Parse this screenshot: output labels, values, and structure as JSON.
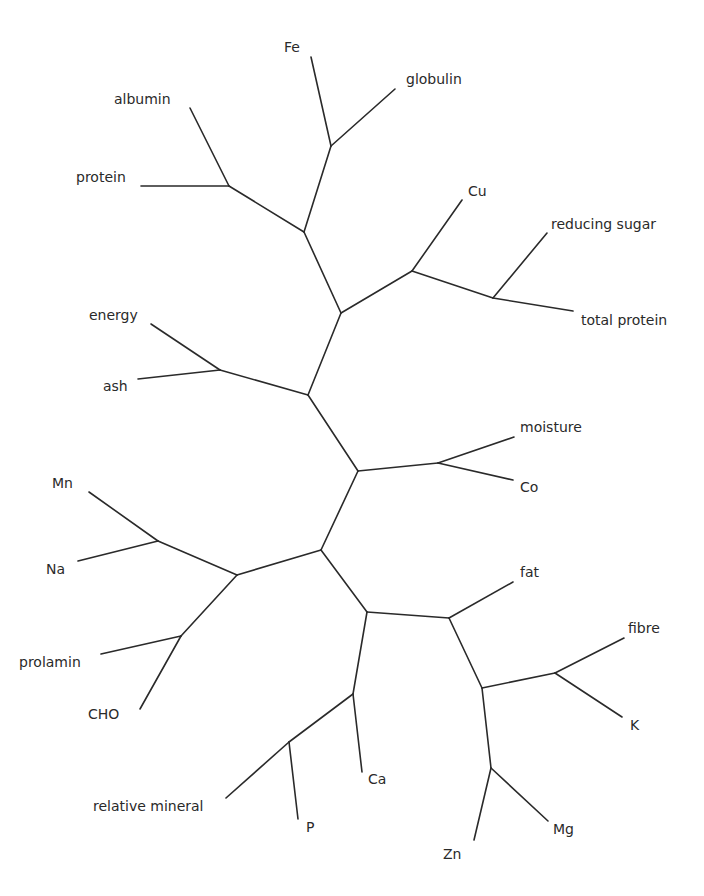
{
  "diagram": {
    "type": "unrooted-tree",
    "colors": {
      "line": "#2a2a2a",
      "text": "#2a2a2a",
      "background": "#ffffff"
    },
    "nodes": {
      "n_fe_glob": [
        331,
        146
      ],
      "n_alb_prot": [
        229,
        186
      ],
      "n_top": [
        304,
        232
      ],
      "n_cu": [
        412,
        271
      ],
      "n_rs_tp": [
        493,
        298
      ],
      "n_upper": [
        341,
        313
      ],
      "n_en_ash": [
        220,
        370
      ],
      "n_mid_up": [
        308,
        395
      ],
      "n_mo_co": [
        438,
        463
      ],
      "n_mid": [
        358,
        471
      ],
      "n_mn_na": [
        158,
        541
      ],
      "n_left": [
        237,
        575
      ],
      "n_center": [
        321,
        550
      ],
      "n_pr_cho": [
        181,
        636
      ],
      "n_low": [
        367,
        612
      ],
      "n_fat": [
        449,
        618
      ],
      "n_ca": [
        353,
        694
      ],
      "n_rm_p": [
        289,
        742
      ],
      "n_fib_k": [
        555,
        673
      ],
      "n_right": [
        482,
        688
      ],
      "n_zn_mg": [
        491,
        768
      ],
      "Fe": [
        311,
        57
      ],
      "globulin": [
        395,
        89
      ],
      "albumin": [
        190,
        108
      ],
      "protein": [
        141,
        186
      ],
      "Cu": [
        462,
        200
      ],
      "reducing sugar": [
        547,
        233
      ],
      "total protein": [
        573,
        311
      ],
      "energy": [
        151,
        324
      ],
      "ash": [
        138,
        379
      ],
      "moisture": [
        514,
        437
      ],
      "Co": [
        513,
        480
      ],
      "Mn": [
        89,
        492
      ],
      "Na": [
        78,
        561
      ],
      "fat": [
        513,
        582
      ],
      "fibre": [
        624,
        638
      ],
      "prolamin": [
        101,
        654
      ],
      "K": [
        622,
        717
      ],
      "CHO": [
        140,
        709
      ],
      "Ca": [
        362,
        772
      ],
      "relative mineral": [
        226,
        798
      ],
      "P": [
        298,
        819
      ],
      "Mg": [
        548,
        821
      ],
      "Zn": [
        474,
        840
      ]
    },
    "edges": [
      [
        "Fe",
        "n_fe_glob"
      ],
      [
        "globulin",
        "n_fe_glob"
      ],
      [
        "n_fe_glob",
        "n_top"
      ],
      [
        "albumin",
        "n_alb_prot"
      ],
      [
        "protein",
        "n_alb_prot"
      ],
      [
        "n_alb_prot",
        "n_top"
      ],
      [
        "n_top",
        "n_upper"
      ],
      [
        "Cu",
        "n_cu"
      ],
      [
        "n_cu",
        "n_upper"
      ],
      [
        "n_cu",
        "n_rs_tp"
      ],
      [
        "reducing sugar",
        "n_rs_tp"
      ],
      [
        "total protein",
        "n_rs_tp"
      ],
      [
        "n_upper",
        "n_mid_up"
      ],
      [
        "energy",
        "n_en_ash"
      ],
      [
        "ash",
        "n_en_ash"
      ],
      [
        "n_en_ash",
        "n_mid_up"
      ],
      [
        "n_mid_up",
        "n_mid"
      ],
      [
        "moisture",
        "n_mo_co"
      ],
      [
        "Co",
        "n_mo_co"
      ],
      [
        "n_mo_co",
        "n_mid"
      ],
      [
        "n_mid",
        "n_center"
      ],
      [
        "Mn",
        "n_mn_na"
      ],
      [
        "Na",
        "n_mn_na"
      ],
      [
        "n_mn_na",
        "n_left"
      ],
      [
        "prolamin",
        "n_pr_cho"
      ],
      [
        "CHO",
        "n_pr_cho"
      ],
      [
        "n_pr_cho",
        "n_left"
      ],
      [
        "n_left",
        "n_center"
      ],
      [
        "n_center",
        "n_low"
      ],
      [
        "n_low",
        "n_fat"
      ],
      [
        "fat",
        "n_fat"
      ],
      [
        "n_low",
        "n_ca"
      ],
      [
        "Ca",
        "n_ca"
      ],
      [
        "n_ca",
        "n_rm_p"
      ],
      [
        "relative mineral",
        "n_rm_p"
      ],
      [
        "P",
        "n_rm_p"
      ],
      [
        "n_fat",
        "n_right"
      ],
      [
        "n_right",
        "n_fib_k"
      ],
      [
        "fibre",
        "n_fib_k"
      ],
      [
        "K",
        "n_fib_k"
      ],
      [
        "n_right",
        "n_zn_mg"
      ],
      [
        "Zn",
        "n_zn_mg"
      ],
      [
        "Mg",
        "n_zn_mg"
      ]
    ],
    "labels": [
      {
        "text": "Fe",
        "x": 284,
        "y": 52
      },
      {
        "text": "globulin",
        "x": 406,
        "y": 84
      },
      {
        "text": "albumin",
        "x": 114,
        "y": 104
      },
      {
        "text": "protein",
        "x": 76,
        "y": 182
      },
      {
        "text": "Cu",
        "x": 468,
        "y": 196
      },
      {
        "text": "reducing sugar",
        "x": 551,
        "y": 229
      },
      {
        "text": "total protein",
        "x": 581,
        "y": 325
      },
      {
        "text": "energy",
        "x": 89,
        "y": 320
      },
      {
        "text": "ash",
        "x": 103,
        "y": 391
      },
      {
        "text": "moisture",
        "x": 520,
        "y": 432
      },
      {
        "text": "Co",
        "x": 520,
        "y": 492
      },
      {
        "text": "Mn",
        "x": 52,
        "y": 488
      },
      {
        "text": "Na",
        "x": 46,
        "y": 574
      },
      {
        "text": "fat",
        "x": 520,
        "y": 577
      },
      {
        "text": "fibre",
        "x": 628,
        "y": 633
      },
      {
        "text": "prolamin",
        "x": 19,
        "y": 667
      },
      {
        "text": "K",
        "x": 630,
        "y": 730
      },
      {
        "text": "CHO",
        "x": 88,
        "y": 719
      },
      {
        "text": "Ca",
        "x": 368,
        "y": 784
      },
      {
        "text": "relative mineral",
        "x": 93,
        "y": 811
      },
      {
        "text": "P",
        "x": 306,
        "y": 832
      },
      {
        "text": "Mg",
        "x": 553,
        "y": 834
      },
      {
        "text": "Zn",
        "x": 443,
        "y": 859
      }
    ]
  }
}
